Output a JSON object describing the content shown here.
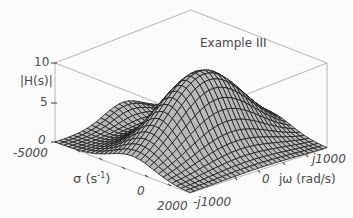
{
  "chart_data": {
    "type": "surface3d",
    "title": "Example III",
    "zlabel": "|H(s)|",
    "xlabel": "σ (s⁻¹)",
    "ylabel": "jω (rad/s)",
    "z_ticks": [
      "10",
      "5",
      "0"
    ],
    "zlim": [
      0,
      10
    ],
    "x_ticks": [
      "-5000",
      "0",
      "2000"
    ],
    "xlim": [
      -5000,
      2000
    ],
    "y_ticks": [
      "-j1000",
      "0",
      "j1000"
    ],
    "ylim": [
      -1000,
      1000
    ],
    "peak_value_approx": 10,
    "peak_location": {
      "sigma_approx": -1000,
      "omega_approx": 0
    },
    "grid": "mesh wireframe, gray fill with dark lines",
    "bounding_box": true
  },
  "labels": {
    "title": "Example III",
    "z_axis": "|H(s)|",
    "z_ticks": [
      "10",
      "5",
      "0"
    ],
    "sigma_axis_prefix": "σ",
    "sigma_axis_unit": "(s",
    "sigma_axis_exp": "-1",
    "sigma_axis_close": ")",
    "sigma_ticks": [
      "-5000",
      "0",
      "2000"
    ],
    "omega_axis": "jω (rad/s)",
    "omega_ticks": [
      "-j1000",
      "0",
      "j1000"
    ]
  }
}
